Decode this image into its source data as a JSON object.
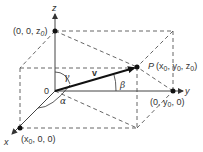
{
  "diagram": {
    "axes": {
      "x_label": "x",
      "y_label": "y",
      "z_label": "z"
    },
    "origin_label": "0",
    "vector_label": "v",
    "angles": {
      "alpha": "α",
      "beta": "β",
      "gamma": "γ"
    },
    "points": {
      "P": {
        "name": "P",
        "coords": "(x0, y0, z0)",
        "coords_display": [
          "(x",
          "0",
          ", y",
          "0",
          ", z",
          "0",
          ")"
        ]
      },
      "z_point": {
        "coords": "(0, 0, z0)",
        "coords_display": [
          "(0, 0, z",
          "0",
          ")"
        ]
      },
      "y_point": {
        "coords": "(0, y0, 0)",
        "coords_display": [
          "(0, y",
          "0",
          ", 0)"
        ]
      },
      "x_point": {
        "coords": "(x0, 0, 0)",
        "coords_display": [
          "(x",
          "0",
          ", 0, 0)"
        ]
      }
    },
    "colors": {
      "line": "#444444",
      "vector": "#111111",
      "text": "#333333",
      "background": "#ffffff"
    }
  }
}
